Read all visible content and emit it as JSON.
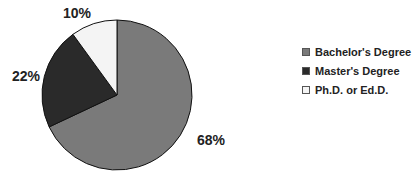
{
  "chart_data": {
    "type": "pie",
    "title": "",
    "categories": [
      "Bachelor's Degree",
      "Master's Degree",
      "Ph.D. or Ed.D."
    ],
    "values": [
      68,
      22,
      10
    ],
    "labels": [
      "68%",
      "22%",
      "10%"
    ],
    "colors": [
      "#7a7a7a",
      "#2a2a2a",
      "#f4f4f4"
    ],
    "legend_position": "right"
  },
  "labels": {
    "bachelors": "68%",
    "masters": "22%",
    "phd": "10%"
  },
  "legend": {
    "items": [
      {
        "label": "Bachelor's Degree",
        "color": "#7a7a7a"
      },
      {
        "label": "Master's Degree",
        "color": "#2a2a2a"
      },
      {
        "label": "Ph.D. or Ed.D.",
        "color": "#f4f4f4"
      }
    ]
  }
}
